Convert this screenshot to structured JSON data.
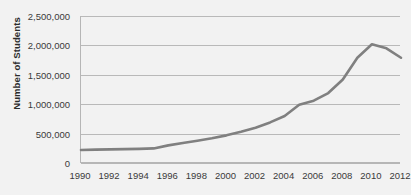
{
  "chart_data": {
    "type": "line",
    "title": "",
    "xlabel": "",
    "ylabel": "Number of Students",
    "xlim": [
      1990,
      2012
    ],
    "ylim": [
      0,
      2500000
    ],
    "grid": true,
    "legend": false,
    "legend_position": "none",
    "line_color": "#808080",
    "background_color": "#f2f2f2",
    "gridline_color": "#b9b9b9",
    "y_ticks": [
      0,
      500000,
      1000000,
      1500000,
      2000000,
      2500000
    ],
    "y_tick_labels": [
      "0",
      "500,000",
      "1,000,000",
      "1,500,000",
      "2,000,000",
      "2,500,000"
    ],
    "x_ticks": [
      1990,
      1992,
      1994,
      1996,
      1998,
      2000,
      2002,
      2004,
      2006,
      2008,
      2010,
      2012
    ],
    "x_tick_labels": [
      "1990",
      "1992",
      "1994",
      "1996",
      "1998",
      "2000",
      "2002",
      "2004",
      "2006",
      "2008",
      "2010",
      "2012"
    ],
    "x": [
      1990,
      1991,
      1992,
      1993,
      1994,
      1995,
      1996,
      1997,
      1998,
      1999,
      2000,
      2001,
      2002,
      2003,
      2004,
      2005,
      2006,
      2007,
      2008,
      2009,
      2010,
      2011,
      2012
    ],
    "values": [
      220000,
      228000,
      232000,
      236000,
      240000,
      248000,
      300000,
      340000,
      380000,
      420000,
      470000,
      530000,
      600000,
      690000,
      800000,
      990000,
      1060000,
      1190000,
      1420000,
      1790000,
      2020000,
      1950000,
      1790000
    ],
    "series": [
      {
        "name": "Number of Students",
        "values": [
          220000,
          228000,
          232000,
          236000,
          240000,
          248000,
          300000,
          340000,
          380000,
          420000,
          470000,
          530000,
          600000,
          690000,
          800000,
          990000,
          1060000,
          1190000,
          1420000,
          1790000,
          2020000,
          1950000,
          1790000
        ]
      }
    ]
  }
}
